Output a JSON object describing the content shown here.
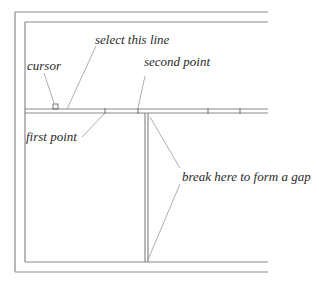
{
  "diagram": {
    "labels": {
      "cursor": "cursor",
      "select_line": "select this line",
      "second_point": "second point",
      "first_point": "first point",
      "break_gap": "break here to form a gap"
    },
    "colors": {
      "wall": "#8a8a8a",
      "leader": "#9a9a9a",
      "text": "#2a2a2a",
      "background": "#ffffff"
    }
  }
}
